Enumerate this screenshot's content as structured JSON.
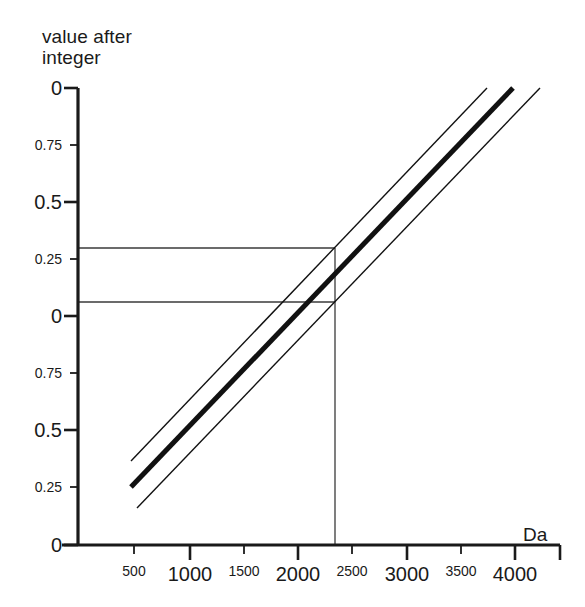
{
  "chart_data": {
    "type": "line",
    "title_lines": [
      "value after",
      "integer"
    ],
    "xlabel": "Da",
    "ylabel": "value after integer",
    "grid": false,
    "legend": "none",
    "xlim": [
      0,
      4280
    ],
    "xticks": [
      500,
      1000,
      1500,
      2000,
      2500,
      3000,
      3500,
      4000
    ],
    "xtick_labels": [
      "500",
      "1000",
      "1500",
      "2000",
      "2500",
      "3000",
      "3500",
      "4000"
    ],
    "ytick_labels": [
      "0",
      "0.75",
      "0.5",
      "0.25",
      "0",
      "0.75",
      "0.5",
      "0.25",
      "0"
    ],
    "ytick_values": [
      1.0,
      0.75,
      0.5,
      0.25,
      0.0,
      -0.25,
      -0.5,
      -0.75,
      -1.0
    ],
    "y_axis_note": "descending fractional cycles, 0 at top",
    "series": [
      {
        "name": "upper-bound-line",
        "style": "thin",
        "x": [
          480,
          3740
        ],
        "y": [
          -0.635,
          1.0
        ]
      },
      {
        "name": "center-line",
        "style": "thick",
        "x": [
          480,
          3975
        ],
        "y": [
          -0.75,
          1.0
        ]
      },
      {
        "name": "lower-bound-line",
        "style": "thin",
        "x": [
          535,
          4220
        ],
        "y": [
          -0.842,
          1.0
        ]
      }
    ],
    "annotations": [
      {
        "name": "upper-readout-guide",
        "type": "horizontal-then-vertical",
        "y": 0.285,
        "x": 2310
      },
      {
        "name": "lower-readout-guide",
        "type": "horizontal",
        "y": 0.048,
        "x": 2310
      },
      {
        "name": "readout-vertical",
        "type": "vertical",
        "x": 2310,
        "y_from": 0.285,
        "y_to": -1.0
      }
    ]
  },
  "geometry": {
    "axis_x": 78,
    "axis_y": 545,
    "plot_top": 88,
    "plot_right": 560,
    "ytick_py": [
      88,
      145,
      202,
      259,
      316,
      373,
      430,
      487,
      545
    ],
    "xtick_px": [
      134,
      190,
      244,
      298,
      352,
      407,
      461,
      515
    ],
    "xtick_sizes": [
      "small",
      "big",
      "small",
      "big",
      "small",
      "big",
      "small",
      "big"
    ],
    "guide_upper_py": 248,
    "guide_lower_py": 302,
    "guide_vertical_px": 335,
    "lines": [
      {
        "name": "upper-bound-line",
        "x1": 131,
        "y1": 461,
        "x2": 487,
        "y2": 88,
        "w": 1.4
      },
      {
        "name": "center-line",
        "x1": 131,
        "y1": 487,
        "x2": 513,
        "y2": 88,
        "w": 5.0
      },
      {
        "name": "lower-bound-line",
        "x1": 137,
        "y1": 508,
        "x2": 540,
        "y2": 88,
        "w": 1.4
      }
    ]
  },
  "labels": {
    "unit": "Da",
    "unit_x": 523,
    "unit_y": 524
  },
  "colors": {
    "ink": "#1a1a1a",
    "line": "#111111",
    "guide": "#3a3a3a",
    "background": "#ffffff"
  }
}
